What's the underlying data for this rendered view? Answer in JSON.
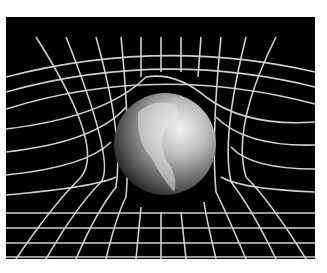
{
  "image": {
    "subject": "Earth resting on a warped spacetime grid",
    "description": "Black-and-white illustration of a globe sitting in a curved grid well, depicting gravity bending spacetime",
    "colors": {
      "background": "#000000",
      "grid": "#d8d8d8",
      "border": "#ffffff"
    }
  }
}
